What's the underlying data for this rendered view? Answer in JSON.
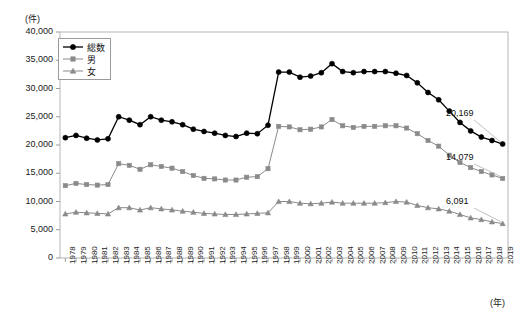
{
  "chart_data": {
    "type": "line",
    "title": "",
    "xlabel": "(年)",
    "ylabel": "(件)",
    "ylim": [
      0,
      40000
    ],
    "ytick_labels": [
      "40,000",
      "35,000",
      "30,000",
      "25,000",
      "20,000",
      "15,000",
      "10,000",
      "5,000",
      "0"
    ],
    "yticks": [
      40000,
      35000,
      30000,
      25000,
      20000,
      15000,
      10000,
      5000,
      0
    ],
    "grid": false,
    "legend_position": "top-left-inside",
    "categories": [
      "1978",
      "1979",
      "1980",
      "1981",
      "1982",
      "1983",
      "1984",
      "1985",
      "1986",
      "1987",
      "1988",
      "1989",
      "1990",
      "1991",
      "1992",
      "1993",
      "1994",
      "1995",
      "1996",
      "1997",
      "1998",
      "1999",
      "2000",
      "2001",
      "2002",
      "2003",
      "2004",
      "2005",
      "2006",
      "2007",
      "2008",
      "2009",
      "2010",
      "2011",
      "2012",
      "2013",
      "2014",
      "2015",
      "2016",
      "2017",
      "2018",
      "2019"
    ],
    "series": [
      {
        "name": "総数",
        "marker": "circle",
        "color": "#000000",
        "values": [
          21300,
          21700,
          21200,
          20900,
          21100,
          25000,
          24400,
          23600,
          25000,
          24400,
          24100,
          23600,
          22800,
          22400,
          22100,
          21700,
          21500,
          22100,
          22000,
          23500,
          32900,
          32900,
          32000,
          32200,
          32800,
          34400,
          33000,
          32800,
          33000,
          33000,
          33000,
          32700,
          32300,
          31000,
          29300,
          28000,
          26000,
          24000,
          22500,
          21400,
          20800,
          20169
        ]
      },
      {
        "name": "男",
        "marker": "square",
        "color": "#8a8a8a",
        "values": [
          12800,
          13200,
          13000,
          12900,
          13000,
          16700,
          16400,
          15700,
          16500,
          16200,
          15900,
          15300,
          14600,
          14100,
          14000,
          13800,
          13800,
          14300,
          14400,
          15800,
          23300,
          23200,
          22700,
          22800,
          23200,
          24500,
          23400,
          23100,
          23300,
          23300,
          23400,
          23400,
          23000,
          22000,
          20800,
          19800,
          18200,
          16900,
          16000,
          15300,
          14700,
          14079
        ]
      },
      {
        "name": "女",
        "marker": "triangle",
        "color": "#8a8a8a",
        "values": [
          7800,
          8100,
          8000,
          7900,
          7800,
          8900,
          8900,
          8500,
          8900,
          8700,
          8500,
          8300,
          8100,
          7900,
          7800,
          7700,
          7700,
          7800,
          7900,
          8000,
          10000,
          10000,
          9700,
          9600,
          9700,
          9900,
          9700,
          9700,
          9700,
          9700,
          9800,
          10000,
          9900,
          9300,
          8900,
          8700,
          8300,
          7700,
          7100,
          6800,
          6400,
          6091
        ]
      }
    ],
    "end_labels": [
      {
        "series": "総数",
        "text": "20,169"
      },
      {
        "series": "男",
        "text": "14,079"
      },
      {
        "series": "女",
        "text": "6,091"
      }
    ]
  }
}
